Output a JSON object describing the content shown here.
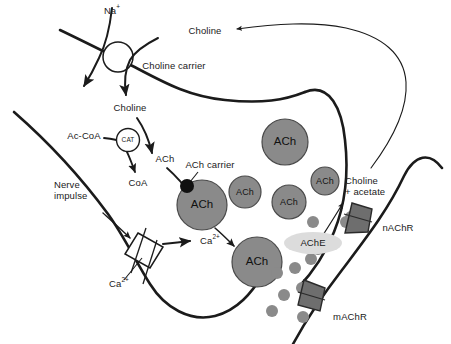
{
  "diagram": {
    "colors": {
      "membrane": "#1b1b1b",
      "vesicle_fill": "#8a8a8a",
      "vesicle_stroke": "#4a4a4a",
      "receptor_fill": "#6e6e6e",
      "receptor_stroke": "#2a2a2a",
      "ache_fill": "#dcdcdc",
      "transmitter_dot": "#8a8a8a",
      "carrier_dot": "#111111",
      "channel_fill": "#ffffff",
      "text": "#1a1a1a",
      "background": "#ffffff"
    }
  },
  "labels": {
    "na_ion": "Na",
    "na_charge": "+",
    "choline_extracellular": "Choline",
    "choline_carrier": "Choline carrier",
    "choline_intracellular": "Choline",
    "ac_coa": "Ac-CoA",
    "cat_enzyme": "CAT",
    "coa": "CoA",
    "ach_new": "ACh",
    "ach_carrier": "ACh carrier",
    "nerve_impulse_line1": "Nerve",
    "nerve_impulse_line2": "impulse",
    "calcium_channel": "Ca",
    "calcium_channel_charge": "2+",
    "calcium_influx": "Ca",
    "calcium_influx_charge": "2+",
    "ache_enzyme": "AChE",
    "products_line1": "Choline",
    "products_line2": "+ acetate",
    "nicotinic_receptor": "nAChR",
    "muscarinic_receptor": "mAChR"
  },
  "vesicles": [
    {
      "id": "vesicle-loading",
      "label": "ACh",
      "cx": 202,
      "cy": 205,
      "r": 25,
      "size": "large"
    },
    {
      "id": "vesicle-top",
      "label": "ACh",
      "cx": 285,
      "cy": 142,
      "r": 23,
      "size": "large"
    },
    {
      "id": "vesicle-mid-left",
      "label": "ACh",
      "cx": 245,
      "cy": 192,
      "r": 16,
      "size": "small"
    },
    {
      "id": "vesicle-mid-right",
      "label": "ACh",
      "cx": 289,
      "cy": 202,
      "r": 17,
      "size": "small"
    },
    {
      "id": "vesicle-upper-right",
      "label": "ACh",
      "cx": 325,
      "cy": 181,
      "r": 14,
      "size": "small"
    },
    {
      "id": "vesicle-fusing",
      "label": "ACh",
      "cx": 257,
      "cy": 262,
      "r": 25,
      "size": "large"
    }
  ],
  "transmitter_dots": [
    {
      "cx": 277,
      "cy": 273,
      "r": 6
    },
    {
      "cx": 295,
      "cy": 268,
      "r": 6
    },
    {
      "cx": 311,
      "cy": 259,
      "r": 6
    },
    {
      "cx": 313,
      "cy": 222,
      "r": 6
    },
    {
      "cx": 346,
      "cy": 222,
      "r": 6
    },
    {
      "cx": 306,
      "cy": 247,
      "r": 6
    },
    {
      "cx": 318,
      "cy": 249,
      "r": 6
    },
    {
      "cx": 284,
      "cy": 295,
      "r": 6
    },
    {
      "cx": 302,
      "cy": 288,
      "r": 6
    },
    {
      "cx": 272,
      "cy": 311,
      "r": 6
    },
    {
      "cx": 303,
      "cy": 317,
      "r": 6
    },
    {
      "cx": 351,
      "cy": 217,
      "r": 6
    }
  ],
  "receptors": [
    {
      "id": "nAChR",
      "label": "nAChR",
      "cx": 356,
      "cy": 222
    },
    {
      "id": "mAChR",
      "label": "mAChR",
      "cx": 311,
      "cy": 298
    }
  ],
  "enzymes": [
    {
      "id": "CAT",
      "label": "CAT",
      "cx": 128,
      "cy": 140,
      "shape": "circle"
    },
    {
      "id": "AChE",
      "label": "AChE",
      "cx": 313,
      "cy": 243,
      "shape": "ellipse"
    }
  ],
  "channels": [
    {
      "id": "choline-carrier-channel",
      "cx": 118,
      "cy": 57,
      "shape": "circle"
    },
    {
      "id": "calcium-channel",
      "cx": 124,
      "cy": 249,
      "shape": "parallelogram"
    }
  ]
}
